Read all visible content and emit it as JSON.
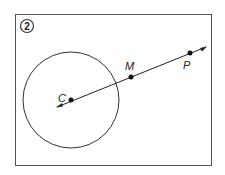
{
  "figure": {
    "number": "2",
    "points": {
      "C": {
        "label": "C"
      },
      "M": {
        "label": "M"
      },
      "P": {
        "label": "P"
      }
    }
  }
}
